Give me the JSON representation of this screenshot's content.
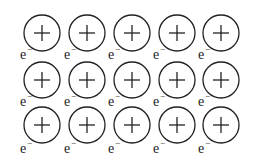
{
  "diagram": {
    "title": "",
    "ion_symbol": "+",
    "electron_symbol": "e",
    "electron_superscript": "−",
    "ions": {
      "rows": 3,
      "cols": 5,
      "centers_x": [
        42,
        87,
        132,
        177,
        221
      ],
      "centers_y": [
        33,
        80,
        125
      ],
      "radius": 18
    },
    "electrons": {
      "rows_y": [
        59,
        106,
        153
      ],
      "cols_x": [
        20,
        64,
        108,
        153,
        198
      ],
      "count": 15
    },
    "colors": {
      "stroke": "#222222",
      "background": "#ffffff"
    }
  }
}
